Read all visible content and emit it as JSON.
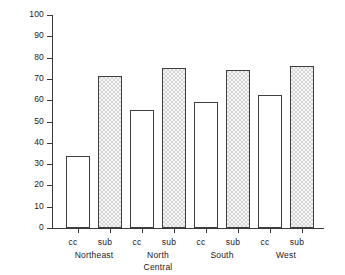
{
  "chart_data": {
    "type": "bar",
    "title": "",
    "xlabel": "",
    "ylabel": "Annual Cost ($)",
    "ylim": [
      0,
      100
    ],
    "ytick_step": 10,
    "yticks": [
      100,
      90,
      80,
      70,
      60,
      50,
      40,
      30,
      20,
      10,
      0
    ],
    "grid": false,
    "legend": "none",
    "categories": [
      "Northeast",
      "North Central",
      "South",
      "West"
    ],
    "category_lines": [
      [
        "Northeast"
      ],
      [
        "North",
        "Central"
      ],
      [
        "South"
      ],
      [
        "West"
      ]
    ],
    "series": [
      {
        "name": "cc",
        "label": "cc",
        "fill": "white",
        "values": [
          34,
          55.5,
          59,
          62.5
        ]
      },
      {
        "name": "sub",
        "label": "sub",
        "fill": "hatched",
        "values": [
          71.5,
          75,
          74,
          76
        ]
      }
    ],
    "bars": [
      {
        "group": "Northeast",
        "series": "cc",
        "label": "cc",
        "value": 34
      },
      {
        "group": "Northeast",
        "series": "sub",
        "label": "sub",
        "value": 71.5
      },
      {
        "group": "North Central",
        "series": "cc",
        "label": "cc",
        "value": 55.5
      },
      {
        "group": "North Central",
        "series": "sub",
        "label": "sub",
        "value": 75
      },
      {
        "group": "South",
        "series": "cc",
        "label": "cc",
        "value": 59
      },
      {
        "group": "South",
        "series": "sub",
        "label": "sub",
        "value": 74
      },
      {
        "group": "West",
        "series": "cc",
        "label": "cc",
        "value": 62.5
      },
      {
        "group": "West",
        "series": "sub",
        "label": "sub",
        "value": 76
      }
    ],
    "colors": {
      "axis": "#3a3a3a",
      "bar_outline": "#3f3f3f",
      "bar_fill_cc": "#ffffff",
      "bar_fill_sub": "#d6d6d6",
      "background": "#ffffff",
      "text": "#1a1a1a"
    }
  }
}
